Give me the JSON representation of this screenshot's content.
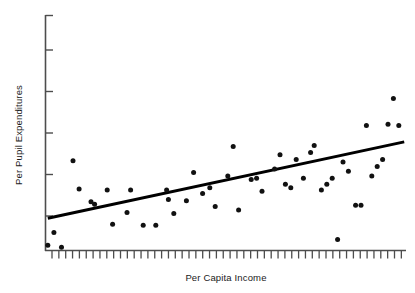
{
  "chart_data": {
    "type": "scatter",
    "title": "",
    "subtitle": "",
    "xlabel": "Per Capita Income",
    "ylabel": "Per Pupil Expenditures",
    "x_tick_labels": [],
    "y_tick_labels": [],
    "xlim": [
      0,
      100
    ],
    "ylim": [
      0,
      100
    ],
    "grid": false,
    "legend": null,
    "annotations": [],
    "axis_style": {
      "x_axis_ticks_count": 52,
      "y_axis_ticks_count": 5,
      "tick_direction": "out",
      "spines": [
        "left",
        "bottom"
      ],
      "axis_color": "#4d4d4d",
      "tick_labels_shown": false
    },
    "marker": {
      "shape": "circle",
      "color": "#111111",
      "size_px": 5
    },
    "series": [
      {
        "name": "States",
        "type": "scatter",
        "points": [
          [
            0.5,
            2.0
          ],
          [
            2.2,
            7.5
          ],
          [
            4.3,
            1.2
          ],
          [
            7.5,
            38.0
          ],
          [
            9.2,
            26.0
          ],
          [
            12.5,
            20.5
          ],
          [
            13.5,
            19.5
          ],
          [
            17.0,
            25.5
          ],
          [
            18.5,
            11.0
          ],
          [
            22.5,
            16.0
          ],
          [
            23.5,
            25.5
          ],
          [
            27.0,
            10.5
          ],
          [
            30.5,
            10.5
          ],
          [
            33.5,
            25.5
          ],
          [
            34.0,
            21.5
          ],
          [
            35.5,
            15.5
          ],
          [
            39.0,
            21.0
          ],
          [
            41.0,
            33.0
          ],
          [
            43.5,
            24.0
          ],
          [
            45.5,
            26.5
          ],
          [
            47.0,
            18.5
          ],
          [
            50.5,
            31.5
          ],
          [
            52.0,
            44.0
          ],
          [
            53.5,
            17.0
          ],
          [
            57.0,
            30.0
          ],
          [
            58.5,
            30.5
          ],
          [
            60.0,
            25.0
          ],
          [
            63.5,
            34.5
          ],
          [
            65.0,
            40.5
          ],
          [
            66.5,
            28.0
          ],
          [
            68.0,
            26.5
          ],
          [
            69.5,
            38.5
          ],
          [
            71.5,
            30.5
          ],
          [
            73.5,
            41.5
          ],
          [
            74.5,
            44.5
          ],
          [
            76.5,
            25.5
          ],
          [
            78.0,
            28.0
          ],
          [
            79.5,
            30.5
          ],
          [
            81.0,
            4.5
          ],
          [
            82.5,
            37.5
          ],
          [
            84.0,
            33.5
          ],
          [
            86.0,
            19.0
          ],
          [
            87.5,
            19.0
          ],
          [
            89.0,
            53.0
          ],
          [
            90.5,
            31.5
          ],
          [
            92.0,
            35.5
          ],
          [
            93.5,
            38.5
          ],
          [
            95.0,
            53.5
          ],
          [
            96.5,
            64.5
          ],
          [
            98.0,
            53.0
          ]
        ]
      },
      {
        "name": "Regression line",
        "type": "line",
        "color": "#000000",
        "width_px": 3,
        "endpoints": [
          [
            0.5,
            13.5
          ],
          [
            99.5,
            46.0
          ]
        ]
      }
    ]
  },
  "figure": {
    "background_color": "#ffffff",
    "width": 415,
    "height": 293
  }
}
